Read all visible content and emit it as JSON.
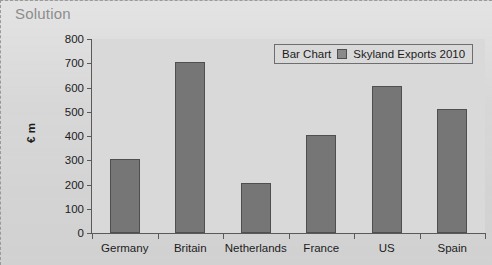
{
  "heading": "Solution",
  "legend": {
    "chart_type_label": "Bar Chart",
    "series_label": "Skyland Exports 2010",
    "swatch_color": "#8a8a8a"
  },
  "colors": {
    "page_background": "#d5d5d5",
    "plot_background": "#d9d9d9",
    "bar_fill": "#767676",
    "bar_stroke": "#4f4f4f",
    "axis": "#5a5a5a",
    "heading_text": "#8d8d8d",
    "body_text": "#1c1c1c"
  },
  "chart_data": {
    "type": "bar",
    "title": "",
    "categories": [
      "Germany",
      "Britain",
      "Netherlands",
      "France",
      "US",
      "Spain"
    ],
    "values": [
      305,
      705,
      205,
      405,
      605,
      510
    ],
    "series": [
      {
        "name": "Skyland Exports 2010",
        "values": [
          305,
          705,
          205,
          405,
          605,
          510
        ]
      }
    ],
    "xlabel": "",
    "ylabel": "€ m",
    "ylim": [
      0,
      800
    ],
    "ytick_values": [
      0,
      100,
      200,
      300,
      400,
      500,
      600,
      700,
      800
    ],
    "ytick_labels": [
      "0",
      "100",
      "200",
      "300",
      "400",
      "500",
      "600",
      "700",
      "800"
    ],
    "grid": false,
    "legend_position": "top-right"
  }
}
